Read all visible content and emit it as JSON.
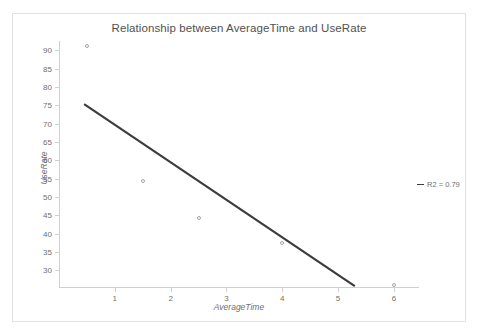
{
  "chart_data": {
    "type": "scatter",
    "title": "Relationship between AverageTime and UseRate",
    "xlabel": "AverageTime",
    "ylabel": "UseRate",
    "xlim": [
      0,
      6.45
    ],
    "ylim": [
      25.2,
      92.5
    ],
    "xticks": [
      1,
      2,
      3,
      4,
      5,
      6
    ],
    "xtick_labels": [
      "1",
      "2",
      "3",
      "4",
      "5",
      "6"
    ],
    "yticks": [
      30,
      35,
      40,
      45,
      50,
      55,
      60,
      65,
      70,
      75,
      80,
      85,
      90
    ],
    "ytick_labels": [
      "30",
      "35",
      "40",
      "45",
      "50",
      "55",
      "60",
      "65",
      "70",
      "75",
      "80",
      "85",
      "90"
    ],
    "grid": false,
    "legend_position": "right",
    "series": [
      {
        "name": "UseRate",
        "type": "scatter",
        "marker": "open-circle",
        "color": "#a6a6a6",
        "points": [
          {
            "x": 0.5,
            "y": 91.2
          },
          {
            "x": 1.5,
            "y": 54.4
          },
          {
            "x": 2.5,
            "y": 44.2
          },
          {
            "x": 4.0,
            "y": 37.5
          },
          {
            "x": 6.0,
            "y": 26.0
          }
        ]
      },
      {
        "name": "R2 = 0.79",
        "type": "line",
        "color": "#3c3c3c",
        "points": [
          {
            "x": 0.45,
            "y": 75.3
          },
          {
            "x": 5.3,
            "y": 25.7
          }
        ]
      }
    ],
    "annotations": [],
    "legend_entries": [
      {
        "label": "R2 = 0.79",
        "marker": "line",
        "color": "#3c3c3c"
      }
    ]
  },
  "colors": {
    "frame_border": "#e2e2e2",
    "axis": "#d0d0d0",
    "tick_text": "#6f6f6f",
    "title_text": "#515151",
    "marker_stroke": "#a6a6a6",
    "trendline": "#3c3c3c",
    "background": "#ffffff"
  }
}
